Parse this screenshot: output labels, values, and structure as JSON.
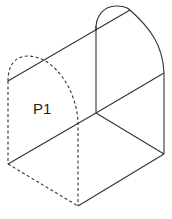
{
  "diagram": {
    "type": "isometric-solid",
    "labels": [
      {
        "id": "p1",
        "text": "P1",
        "x": 33,
        "y": 114
      }
    ],
    "colors": {
      "stroke": "#333333",
      "background": "#ffffff"
    },
    "vertices": {
      "front_top_left": [
        8,
        81
      ],
      "front_bottom_left": [
        8,
        164
      ],
      "front_bottom_right": [
        78,
        206
      ],
      "front_arch_end": [
        78,
        122
      ],
      "back_top_left": [
        96,
        31
      ],
      "back_bottom_left": [
        96,
        113
      ],
      "back_top_right": [
        164,
        73
      ],
      "back_bottom_right": [
        164,
        154
      ],
      "arch_peak": [
        130,
        10
      ]
    }
  }
}
